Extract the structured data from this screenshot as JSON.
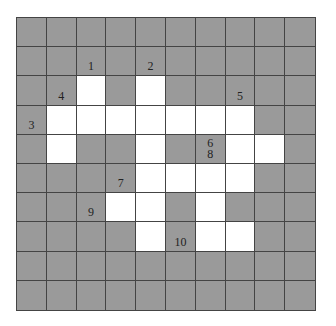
{
  "puzzle": {
    "type": "crossword-grid",
    "rows": 10,
    "cols": 10,
    "colors": {
      "block": "#9a9a9a",
      "open": "#ffffff",
      "line": "#444444"
    },
    "grid": [
      [
        0,
        0,
        0,
        0,
        0,
        0,
        0,
        0,
        0,
        0
      ],
      [
        0,
        0,
        0,
        0,
        0,
        0,
        0,
        0,
        0,
        0
      ],
      [
        0,
        0,
        1,
        0,
        1,
        0,
        0,
        0,
        0,
        0
      ],
      [
        0,
        1,
        1,
        1,
        1,
        1,
        1,
        1,
        0,
        0
      ],
      [
        0,
        1,
        0,
        0,
        1,
        0,
        0,
        1,
        1,
        0
      ],
      [
        0,
        0,
        0,
        0,
        1,
        1,
        1,
        1,
        0,
        0
      ],
      [
        0,
        0,
        0,
        1,
        1,
        0,
        1,
        0,
        0,
        0
      ],
      [
        0,
        0,
        0,
        0,
        1,
        0,
        1,
        1,
        0,
        0
      ],
      [
        0,
        0,
        0,
        0,
        0,
        0,
        0,
        0,
        0,
        0
      ],
      [
        0,
        0,
        0,
        0,
        0,
        0,
        0,
        0,
        0,
        0
      ]
    ],
    "labels": [
      {
        "row": 1,
        "col": 2,
        "text": "1"
      },
      {
        "row": 1,
        "col": 4,
        "text": "2"
      },
      {
        "row": 3,
        "col": 0,
        "text": "3"
      },
      {
        "row": 2,
        "col": 1,
        "text": "4"
      },
      {
        "row": 2,
        "col": 7,
        "text": "5"
      },
      {
        "row": 4,
        "col": 6,
        "text": "6\n8"
      },
      {
        "row": 5,
        "col": 3,
        "text": "7"
      },
      {
        "row": 6,
        "col": 2,
        "text": "9"
      },
      {
        "row": 7,
        "col": 5,
        "text": "10"
      }
    ]
  }
}
